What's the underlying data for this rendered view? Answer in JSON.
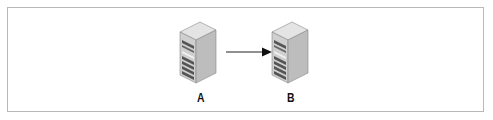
{
  "diagram": {
    "nodes": [
      {
        "id": "A",
        "label": "A",
        "type": "server"
      },
      {
        "id": "B",
        "label": "B",
        "type": "server"
      }
    ],
    "edges": [
      {
        "from": "A",
        "to": "B",
        "type": "directed-arrow"
      }
    ]
  },
  "colors": {
    "border": "#b8b8b8",
    "server_side": "#c8c8c8",
    "server_top": "#e2e2e2",
    "server_front": "#d4d4d4",
    "arrow": "#222222"
  }
}
